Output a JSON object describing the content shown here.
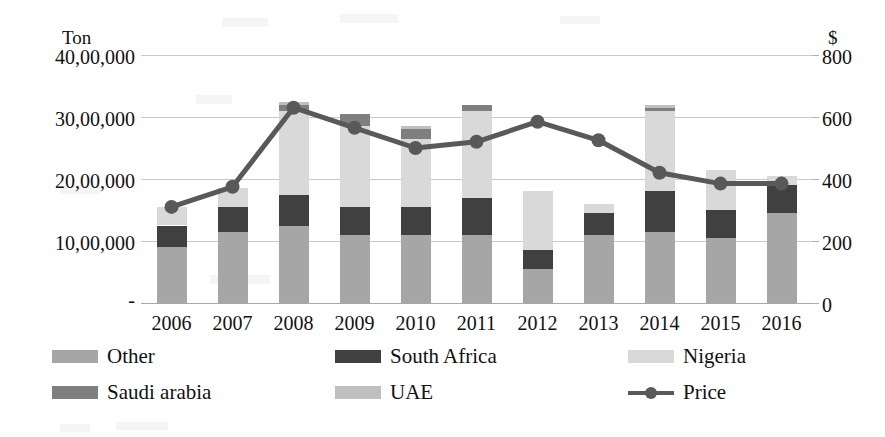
{
  "chart_data": {
    "type": "bar",
    "title": "",
    "subtitle": "",
    "xlabel": "",
    "ylabel": "Ton",
    "y2label": "$",
    "grid": true,
    "legend_position": "bottom",
    "categories": [
      "2006",
      "2007",
      "2008",
      "2009",
      "2010",
      "2011",
      "2012",
      "2013",
      "2014",
      "2015",
      "2016"
    ],
    "ylim": [
      0,
      4000000
    ],
    "yticks": [
      0,
      1000000,
      2000000,
      3000000,
      4000000
    ],
    "ytick_labels": [
      "-",
      "10,00,000",
      "20,00,000",
      "30,00,000",
      "40,00,000"
    ],
    "y2lim": [
      0,
      800
    ],
    "y2ticks": [
      0,
      200,
      400,
      600,
      800
    ],
    "y2tick_labels": [
      "0",
      "200",
      "400",
      "600",
      "800"
    ],
    "stacked": true,
    "series": [
      {
        "name": "Other",
        "axis": "left",
        "color": "#a6a6a6",
        "values": [
          900000,
          1150000,
          1250000,
          1100000,
          1100000,
          1100000,
          550000,
          1100000,
          1150000,
          1050000,
          1450000
        ]
      },
      {
        "name": "South Africa",
        "axis": "left",
        "color": "#404040",
        "values": [
          350000,
          400000,
          500000,
          450000,
          450000,
          600000,
          300000,
          350000,
          650000,
          450000,
          450000
        ]
      },
      {
        "name": "Nigeria",
        "axis": "left",
        "color": "#d9d9d9",
        "values": [
          300000,
          300000,
          1350000,
          1300000,
          1100000,
          1400000,
          950000,
          150000,
          1300000,
          650000,
          150000
        ]
      },
      {
        "name": "Saudi arabia",
        "axis": "left",
        "color": "#7f7f7f",
        "values": [
          0,
          0,
          100000,
          200000,
          150000,
          100000,
          0,
          0,
          50000,
          0,
          0
        ]
      },
      {
        "name": "UAE",
        "axis": "left",
        "color": "#bfbfbf",
        "values": [
          0,
          0,
          50000,
          0,
          50000,
          0,
          0,
          0,
          50000,
          0,
          0
        ]
      },
      {
        "name": "Price",
        "axis": "right",
        "color": "#595959",
        "type": "line",
        "values": [
          310,
          375,
          630,
          565,
          500,
          520,
          585,
          525,
          420,
          385,
          385
        ]
      }
    ],
    "totals": [
      1550000,
      1850000,
      3250000,
      3050000,
      2850000,
      3200000,
      1800000,
      1600000,
      3200000,
      2150000,
      2050000
    ]
  },
  "axes": {
    "left_unit": "Ton",
    "right_unit": "$",
    "left_ticks": [
      "40,00,000",
      "30,00,000",
      "20,00,000",
      "10,00,000",
      "-"
    ],
    "right_ticks": [
      "800",
      "600",
      "400",
      "200",
      "0"
    ],
    "years": [
      "2006",
      "2007",
      "2008",
      "2009",
      "2010",
      "2011",
      "2012",
      "2013",
      "2014",
      "2015",
      "2016"
    ]
  },
  "legend": {
    "items": [
      {
        "label": "Other",
        "swatch": "#a6a6a6",
        "kind": "swatch"
      },
      {
        "label": "South Africa",
        "swatch": "#404040",
        "kind": "swatch"
      },
      {
        "label": "Nigeria",
        "swatch": "#d9d9d9",
        "kind": "swatch"
      },
      {
        "label": "Saudi arabia",
        "swatch": "#7f7f7f",
        "kind": "swatch"
      },
      {
        "label": "UAE",
        "swatch": "#bfbfbf",
        "kind": "swatch"
      },
      {
        "label": "Price",
        "swatch": "#595959",
        "kind": "line"
      }
    ]
  }
}
